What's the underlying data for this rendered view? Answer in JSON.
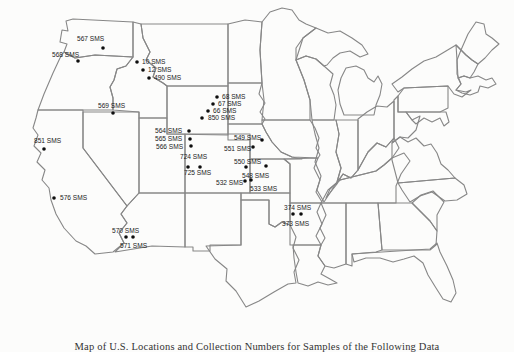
{
  "page": {
    "background_color": "#fcfcfb",
    "map_outline_color": "#878787",
    "dot_color": "#0e0e0e",
    "label_color": "#1b1b1b"
  },
  "caption": {
    "text": "Map of U.S. Locations and Collection Numbers for Samples of the Following Data"
  },
  "stations": [
    {
      "label": "567 SMS",
      "label_x": 77,
      "label_y": 41,
      "dot_x": 103,
      "dot_y": 48
    },
    {
      "label": "568 SMS",
      "label_x": 52,
      "label_y": 57,
      "dot_x": 78,
      "dot_y": 61
    },
    {
      "label": "10 SMS",
      "label_x": 142,
      "label_y": 64,
      "dot_x": 137,
      "dot_y": 62
    },
    {
      "label": "12 SMS",
      "label_x": 148,
      "label_y": 72,
      "dot_x": 143,
      "dot_y": 70
    },
    {
      "label": "490 SMS",
      "label_x": 154,
      "label_y": 80,
      "dot_x": 149,
      "dot_y": 78
    },
    {
      "label": "569 SMS",
      "label_x": 98,
      "label_y": 108,
      "dot_x": 113,
      "dot_y": 113
    },
    {
      "label": "68 SMS",
      "label_x": 222,
      "label_y": 99,
      "dot_x": 217,
      "dot_y": 97
    },
    {
      "label": "67 SMS",
      "label_x": 218,
      "label_y": 106,
      "dot_x": 213,
      "dot_y": 104
    },
    {
      "label": "66 SMS",
      "label_x": 213,
      "label_y": 113,
      "dot_x": 208,
      "dot_y": 111
    },
    {
      "label": "850 SMS",
      "label_x": 208,
      "label_y": 120,
      "dot_x": 202,
      "dot_y": 118
    },
    {
      "label": "564 SMS",
      "label_x": 155,
      "label_y": 133,
      "dot_x": 189,
      "dot_y": 131
    },
    {
      "label": "565 SMS",
      "label_x": 155,
      "label_y": 141,
      "dot_x": 190,
      "dot_y": 139
    },
    {
      "label": "566 SMS",
      "label_x": 156,
      "label_y": 149,
      "dot_x": 191,
      "dot_y": 146
    },
    {
      "label": "724 SMS",
      "label_x": 180,
      "label_y": 159,
      "dot_x": 188,
      "dot_y": 167
    },
    {
      "label": "725 SMS",
      "label_x": 184,
      "label_y": 175,
      "dot_x": 200,
      "dot_y": 167
    },
    {
      "label": "549 SMS",
      "label_x": 234,
      "label_y": 140,
      "dot_x": 262,
      "dot_y": 140
    },
    {
      "label": "551 SMS",
      "label_x": 224,
      "label_y": 151,
      "dot_x": 253,
      "dot_y": 147
    },
    {
      "label": "550 SMS",
      "label_x": 234,
      "label_y": 164,
      "dot_x": 246,
      "dot_y": 167
    },
    {
      "label": "548 SMS",
      "label_x": 242,
      "label_y": 178,
      "dot_x": 266,
      "dot_y": 166
    },
    {
      "label": "532 SMS",
      "label_x": 216,
      "label_y": 185,
      "dot_x": 245,
      "dot_y": 181
    },
    {
      "label": "533 SMS",
      "label_x": 250,
      "label_y": 191,
      "dot_x": 251,
      "dot_y": 180
    },
    {
      "label": "851 SMS",
      "label_x": 34,
      "label_y": 143,
      "dot_x": 44,
      "dot_y": 149
    },
    {
      "label": "576 SMS",
      "label_x": 60,
      "label_y": 200,
      "dot_x": 54,
      "dot_y": 198
    },
    {
      "label": "570 SMS",
      "label_x": 112,
      "label_y": 233,
      "dot_x": 126,
      "dot_y": 237
    },
    {
      "label": "571 SMS",
      "label_x": 120,
      "label_y": 248,
      "dot_x": 133,
      "dot_y": 237
    },
    {
      "label": "374 SMS",
      "label_x": 284,
      "label_y": 210,
      "dot_x": 293,
      "dot_y": 214
    },
    {
      "label": "373 SMS",
      "label_x": 282,
      "label_y": 226,
      "dot_x": 301,
      "dot_y": 214
    }
  ]
}
